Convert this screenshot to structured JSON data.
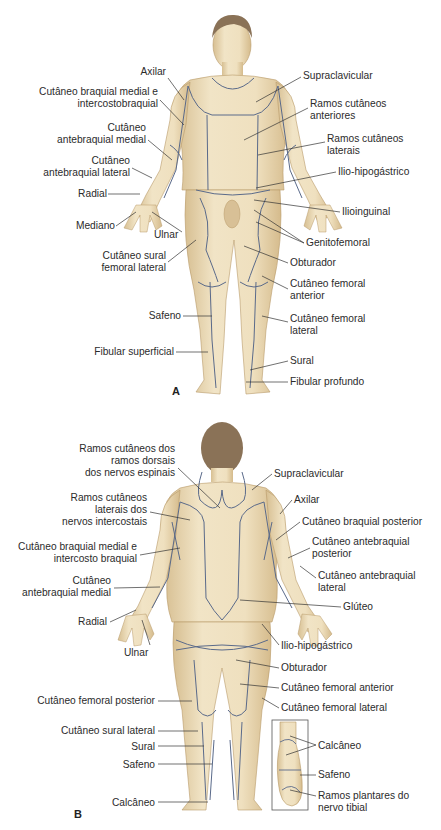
{
  "figure": {
    "language": "pt",
    "skin_color": "#ecdcb8",
    "skin_shade": "#c9a978",
    "hair_color": "#8a7257",
    "nerve_line_color": "#5a6a8a",
    "leader_line_color": "#333333"
  },
  "panels": [
    {
      "id": "A",
      "view": "anterior",
      "label": "A",
      "labels_left": [
        {
          "lines": [
            "Axilar"
          ],
          "x": 166,
          "y": 72
        },
        {
          "lines": [
            "Cutâneo braquial medial e",
            "intercostobraquial"
          ],
          "x": 158,
          "y": 92
        },
        {
          "lines": [
            "Cutâneo",
            "antebraquial medial"
          ],
          "x": 146,
          "y": 128
        },
        {
          "lines": [
            "Cutâneo",
            "antebraquial lateral"
          ],
          "x": 130,
          "y": 158
        },
        {
          "lines": [
            "Radial"
          ],
          "x": 106,
          "y": 190
        },
        {
          "lines": [
            "Mediano"
          ],
          "x": 114,
          "y": 222
        },
        {
          "lines": [
            "Ulnar"
          ],
          "x": 178,
          "y": 230
        },
        {
          "lines": [
            "Cutâneo sural",
            "femoral lateral"
          ],
          "x": 166,
          "y": 252
        },
        {
          "lines": [
            "Safeno"
          ],
          "x": 181,
          "y": 311
        },
        {
          "lines": [
            "Fibular superficial"
          ],
          "x": 174,
          "y": 347
        }
      ],
      "labels_right": [
        {
          "lines": [
            "Supraclavicular"
          ],
          "x": 303,
          "y": 72
        },
        {
          "lines": [
            "Ramos cutâneos",
            "anteriores"
          ],
          "x": 310,
          "y": 100
        },
        {
          "lines": [
            "Ramos cutâneos",
            "laterais"
          ],
          "x": 327,
          "y": 135
        },
        {
          "lines": [
            "Ilio-hipogástrico"
          ],
          "x": 338,
          "y": 167
        },
        {
          "lines": [
            "Ilioinguinal"
          ],
          "x": 342,
          "y": 207
        },
        {
          "lines": [
            "Genitofemoral"
          ],
          "x": 306,
          "y": 238
        },
        {
          "lines": [
            "Obturador"
          ],
          "x": 290,
          "y": 258
        },
        {
          "lines": [
            "Cutâneo femoral",
            "anterior"
          ],
          "x": 290,
          "y": 279
        },
        {
          "lines": [
            "Cutâneo femoral",
            "lateral"
          ],
          "x": 290,
          "y": 314
        },
        {
          "lines": [
            "Sural"
          ],
          "x": 290,
          "y": 356
        },
        {
          "lines": [
            "Fibular profundo"
          ],
          "x": 290,
          "y": 377
        }
      ],
      "panel_label_pos": {
        "x": 173,
        "y": 386
      }
    },
    {
      "id": "B",
      "view": "posterior",
      "label": "B",
      "labels_left": [
        {
          "lines": [
            "Ramos cutâneos dos",
            "ramos dorsais",
            "dos nervos espinais"
          ],
          "x": 176,
          "y": 444
        },
        {
          "lines": [
            "Ramos cutâneos",
            "laterais dos",
            "nervos intercostais"
          ],
          "x": 148,
          "y": 493
        },
        {
          "lines": [
            "Cutâneo braquial medial e",
            "intercosto braquial"
          ],
          "x": 138,
          "y": 541
        },
        {
          "lines": [
            "Cutâneo",
            "antebraquial medial"
          ],
          "x": 112,
          "y": 575
        },
        {
          "lines": [
            "Radial"
          ],
          "x": 108,
          "y": 617
        },
        {
          "lines": [
            "Ulnar"
          ],
          "x": 148,
          "y": 647
        },
        {
          "lines": [
            "Cutâneo femoral posterior"
          ],
          "x": 156,
          "y": 695
        },
        {
          "lines": [
            "Cutâneo sural lateral"
          ],
          "x": 156,
          "y": 725
        },
        {
          "lines": [
            "Sural"
          ],
          "x": 156,
          "y": 741
        },
        {
          "lines": [
            "Safeno"
          ],
          "x": 156,
          "y": 759
        },
        {
          "lines": [
            "Calcâneo"
          ],
          "x": 156,
          "y": 797
        }
      ],
      "labels_right": [
        {
          "lines": [
            "Supraclavicular"
          ],
          "x": 274,
          "y": 468
        },
        {
          "lines": [
            "Axilar"
          ],
          "x": 294,
          "y": 495
        },
        {
          "lines": [
            "Cutâneo braquial posterior"
          ],
          "x": 302,
          "y": 517
        },
        {
          "lines": [
            "Cutâneo antebraquial",
            "posterior"
          ],
          "x": 312,
          "y": 537
        },
        {
          "lines": [
            "Cutâneo antebraquial",
            "lateral"
          ],
          "x": 318,
          "y": 570
        },
        {
          "lines": [
            "Glúteo"
          ],
          "x": 343,
          "y": 602
        },
        {
          "lines": [
            "Ilio-hipogástrico"
          ],
          "x": 281,
          "y": 640
        },
        {
          "lines": [
            "Obturador"
          ],
          "x": 281,
          "y": 663
        },
        {
          "lines": [
            "Cutâneo femoral anterior"
          ],
          "x": 281,
          "y": 683
        },
        {
          "lines": [
            "Cutâneo femoral lateral"
          ],
          "x": 281,
          "y": 703
        }
      ],
      "inset_labels": [
        {
          "lines": [
            "Calcâneo"
          ],
          "x": 318,
          "y": 740
        },
        {
          "lines": [
            "Safeno"
          ],
          "x": 318,
          "y": 770
        },
        {
          "lines": [
            "Ramos plantares do",
            "nervo tibial"
          ],
          "x": 318,
          "y": 791
        }
      ],
      "panel_label_pos": {
        "x": 75,
        "y": 810
      }
    }
  ]
}
